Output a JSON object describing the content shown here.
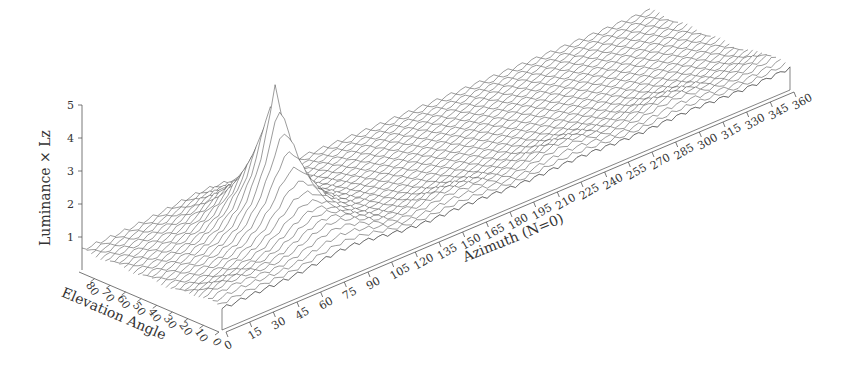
{
  "chart_data": {
    "type": "surface3d",
    "title": "",
    "zlabel": "Luminance × Lz",
    "xlabel": "Azimuth (N=0)",
    "ylabel": "Elevation Angle",
    "z_ticks": [
      "1",
      "2",
      "3",
      "4",
      "5"
    ],
    "z_range": [
      0,
      5
    ],
    "x_ticks": [
      "0",
      "15",
      "30",
      "45",
      "60",
      "75",
      "90",
      "105",
      "120",
      "135",
      "150",
      "165",
      "180",
      "195",
      "210",
      "225",
      "240",
      "255",
      "270",
      "285",
      "300",
      "315",
      "330",
      "345",
      "360"
    ],
    "x_range": [
      0,
      360
    ],
    "y_ticks": [
      "0",
      "10",
      "20",
      "30",
      "40",
      "50",
      "60",
      "70",
      "80"
    ],
    "y_range": [
      0,
      90
    ],
    "peak": {
      "azimuth": 78,
      "elevation": 45,
      "value": 5.0
    },
    "baseline_value": 0.6,
    "grid": false,
    "legend": "none"
  }
}
